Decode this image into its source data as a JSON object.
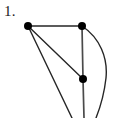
{
  "figure": {
    "label": "1.",
    "type": "undirected-graph-diagram",
    "canvas": {
      "width": 118,
      "height": 118,
      "background": "#ffffff"
    },
    "cropped_at_bottom": true
  },
  "style": {
    "edge_color": "#262626",
    "edge_width": 1.5,
    "vertex_color": "#000000",
    "vertex_radius": 4,
    "label_color": "#1a1a1a"
  },
  "vertices": [
    {
      "id": "v1",
      "name": "top-left-vertex",
      "x": 28,
      "y": 26
    },
    {
      "id": "v2",
      "name": "top-right-vertex",
      "x": 82,
      "y": 26
    },
    {
      "id": "v3",
      "name": "middle-vertex",
      "x": 83,
      "y": 79
    }
  ],
  "edges": [
    {
      "id": "e1",
      "name": "edge-top-horizontal",
      "from": "v1",
      "to": "v2",
      "shape": "straight",
      "path": "M 28 26 L 82 26"
    },
    {
      "id": "e2",
      "name": "edge-diagonal-to-middle",
      "from": "v1",
      "to": "v3",
      "shape": "straight",
      "path": "M 28 26 L 83 79"
    },
    {
      "id": "e3",
      "name": "edge-vertical-right",
      "from": "v2",
      "to": "v3",
      "shape": "straight",
      "path": "M 82 26 L 83 79"
    },
    {
      "id": "e4",
      "name": "edge-vertical-continues-below",
      "from": "v3",
      "to": "crop-bottom",
      "shape": "straight",
      "path": "M 83 79 L 84 118"
    },
    {
      "id": "e5",
      "name": "edge-long-diagonal-to-crop",
      "from": "v1",
      "to": "crop-bottom",
      "shape": "straight",
      "path": "M 28 26 L 72 118"
    },
    {
      "id": "e6",
      "name": "edge-curved-arc-right",
      "from": "v2",
      "to": "crop-bottom",
      "shape": "curved",
      "bulge_direction": "right",
      "max_x": 107,
      "path": "M 82 26 C 100 38 108 58 106 78 C 104 96 100 108 96 118"
    }
  ]
}
